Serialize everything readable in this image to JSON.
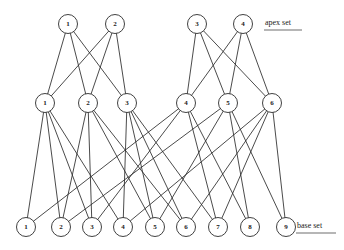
{
  "figure": {
    "background_color": "#ffffff",
    "ink_color": "#2b2b2b",
    "width": 344,
    "height": 250
  },
  "labels": {
    "apex_set": "apex set",
    "base_set": "base set"
  },
  "layers": {
    "apex": {
      "name": "apex set",
      "y": 24,
      "radius": 9.5,
      "nodes": [
        {
          "id": "a1",
          "label": "1",
          "x": 68,
          "y": 24
        },
        {
          "id": "a2",
          "label": "2",
          "x": 115,
          "y": 24
        },
        {
          "id": "a3",
          "label": "3",
          "x": 197,
          "y": 24
        },
        {
          "id": "a4",
          "label": "4",
          "x": 243,
          "y": 24
        }
      ]
    },
    "middle": {
      "name": "middle set",
      "y": 103,
      "radius": 9.5,
      "nodes": [
        {
          "id": "m1",
          "label": "1",
          "x": 45,
          "y": 103
        },
        {
          "id": "m2",
          "label": "2",
          "x": 88,
          "y": 103
        },
        {
          "id": "m3",
          "label": "3",
          "x": 127,
          "y": 103
        },
        {
          "id": "m4",
          "label": "4",
          "x": 186,
          "y": 103
        },
        {
          "id": "m5",
          "label": "5",
          "x": 228,
          "y": 103
        },
        {
          "id": "m6",
          "label": "6",
          "x": 272,
          "y": 103
        }
      ]
    },
    "base": {
      "name": "base set",
      "y": 227,
      "radius": 9.5,
      "nodes": [
        {
          "id": "b1",
          "label": "1",
          "x": 26,
          "y": 227
        },
        {
          "id": "b2",
          "label": "2",
          "x": 61,
          "y": 227
        },
        {
          "id": "b3",
          "label": "3",
          "x": 92,
          "y": 227
        },
        {
          "id": "b4",
          "label": "4",
          "x": 123,
          "y": 227
        },
        {
          "id": "b5",
          "label": "5",
          "x": 155,
          "y": 227
        },
        {
          "id": "b6",
          "label": "6",
          "x": 186,
          "y": 227
        },
        {
          "id": "b7",
          "label": "7",
          "x": 218,
          "y": 227
        },
        {
          "id": "b8",
          "label": "8",
          "x": 250,
          "y": 227
        },
        {
          "id": "b9",
          "label": "9",
          "x": 286,
          "y": 227
        }
      ]
    }
  },
  "edges": {
    "apex_to_middle": [
      [
        "a1",
        "m1"
      ],
      [
        "a1",
        "m2"
      ],
      [
        "a1",
        "m3"
      ],
      [
        "a2",
        "m1"
      ],
      [
        "a2",
        "m2"
      ],
      [
        "a2",
        "m3"
      ],
      [
        "a3",
        "m4"
      ],
      [
        "a3",
        "m5"
      ],
      [
        "a3",
        "m6"
      ],
      [
        "a4",
        "m4"
      ],
      [
        "a4",
        "m5"
      ],
      [
        "a4",
        "m6"
      ]
    ],
    "middle_to_base": [
      [
        "m1",
        "b1"
      ],
      [
        "m1",
        "b2"
      ],
      [
        "m1",
        "b3"
      ],
      [
        "m1",
        "b4"
      ],
      [
        "m2",
        "b2"
      ],
      [
        "m2",
        "b3"
      ],
      [
        "m2",
        "b5"
      ],
      [
        "m2",
        "b6"
      ],
      [
        "m3",
        "b4"
      ],
      [
        "m3",
        "b5"
      ],
      [
        "m3",
        "b6"
      ],
      [
        "m3",
        "b7"
      ],
      [
        "m4",
        "b1"
      ],
      [
        "m4",
        "b3"
      ],
      [
        "m4",
        "b7"
      ],
      [
        "m4",
        "b8"
      ],
      [
        "m5",
        "b2"
      ],
      [
        "m5",
        "b5"
      ],
      [
        "m5",
        "b8"
      ],
      [
        "m5",
        "b9"
      ],
      [
        "m6",
        "b4"
      ],
      [
        "m6",
        "b6"
      ],
      [
        "m6",
        "b7"
      ],
      [
        "m6",
        "b9"
      ]
    ]
  },
  "annotations": {
    "apex_label": {
      "text": "apex set",
      "x": 265,
      "y": 23,
      "underline_x1": 264,
      "underline_x2": 302,
      "underline_y": 30
    },
    "base_label": {
      "text": "base set",
      "x": 297,
      "y": 226,
      "underline_x1": 296,
      "underline_x2": 336,
      "underline_y": 233
    }
  }
}
